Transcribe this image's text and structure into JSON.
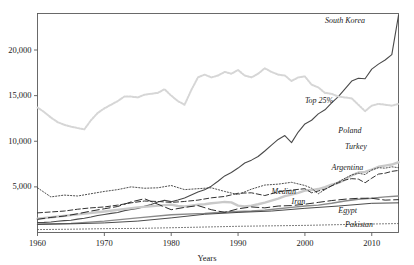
{
  "chart_data": {
    "type": "line",
    "title": "",
    "xlabel": "Years",
    "ylabel": "",
    "xlim": [
      1960,
      2014
    ],
    "ylim": [
      0,
      24000
    ],
    "grid": false,
    "legend_position": "inline-right-labels",
    "xticks": [
      1960,
      1970,
      1980,
      1990,
      2000,
      2010
    ],
    "xtick_labels": [
      "1960",
      "1970",
      "1980",
      "1990",
      "2000",
      "2010"
    ],
    "yticks": [
      5000,
      10000,
      15000,
      20000
    ],
    "ytick_labels": [
      "5,000",
      "10,000",
      "15,000",
      "20,000"
    ],
    "series": [
      {
        "name": "South Korea",
        "label": "South Korea",
        "style": "solid",
        "color": "#4a4a4a",
        "width": 1.1,
        "label_x": 2003,
        "label_y": 23100,
        "x": [
          1960,
          1961,
          1962,
          1963,
          1964,
          1965,
          1966,
          1967,
          1968,
          1969,
          1970,
          1971,
          1972,
          1973,
          1974,
          1975,
          1976,
          1977,
          1978,
          1979,
          1980,
          1981,
          1982,
          1983,
          1984,
          1985,
          1986,
          1987,
          1988,
          1989,
          1990,
          1991,
          1992,
          1993,
          1994,
          1995,
          1996,
          1997,
          1998,
          1999,
          2000,
          2001,
          2002,
          2003,
          2004,
          2005,
          2006,
          2007,
          2008,
          2009,
          2010,
          2011,
          2012,
          2013,
          2014
        ],
        "y": [
          1100,
          1110,
          1150,
          1230,
          1300,
          1350,
          1470,
          1560,
          1690,
          1860,
          1980,
          2100,
          2200,
          2400,
          2520,
          2640,
          2860,
          3060,
          3340,
          3530,
          3380,
          3570,
          3790,
          4110,
          4440,
          4690,
          5080,
          5620,
          6200,
          6570,
          7060,
          7620,
          7930,
          8330,
          8930,
          9580,
          10200,
          10620,
          9850,
          11010,
          11900,
          12300,
          13000,
          13450,
          14200,
          14900,
          15750,
          16600,
          16900,
          16850,
          17900,
          18450,
          18900,
          19500,
          23800
        ]
      },
      {
        "name": "Top 25%",
        "label": "Top 25%",
        "style": "dotted-light",
        "color": "#d6d6d6",
        "width": 2.0,
        "label_x": 2000,
        "label_y": 14300,
        "x": [
          1960,
          1961,
          1962,
          1963,
          1964,
          1965,
          1966,
          1967,
          1968,
          1969,
          1970,
          1971,
          1972,
          1973,
          1974,
          1975,
          1976,
          1977,
          1978,
          1979,
          1980,
          1981,
          1982,
          1983,
          1984,
          1985,
          1986,
          1987,
          1988,
          1989,
          1990,
          1991,
          1992,
          1993,
          1994,
          1995,
          1996,
          1997,
          1998,
          1999,
          2000,
          2001,
          2002,
          2003,
          2004,
          2005,
          2006,
          2007,
          2008,
          2009,
          2010,
          2011,
          2012,
          2013,
          2014
        ],
        "y": [
          13700,
          13200,
          12600,
          12100,
          11800,
          11600,
          11450,
          11300,
          12300,
          13100,
          13600,
          14000,
          14400,
          14900,
          14900,
          14800,
          15100,
          15200,
          15300,
          15700,
          15000,
          14400,
          14000,
          15600,
          17000,
          17300,
          17000,
          17200,
          17600,
          17400,
          17800,
          17200,
          17000,
          17400,
          18000,
          17600,
          17300,
          17200,
          16600,
          17000,
          17100,
          16200,
          15900,
          15300,
          15200,
          14900,
          14800,
          14700,
          14000,
          13300,
          13900,
          14100,
          14000,
          13900,
          14100
        ]
      },
      {
        "name": "Poland",
        "label": "Poland",
        "style": "solid-thick-gray",
        "color": "#c9c9c9",
        "width": 2.4,
        "label_x": 2005,
        "label_y": 11050,
        "x": [
          1960,
          1965,
          1970,
          1975,
          1980,
          1981,
          1982,
          1983,
          1984,
          1985,
          1986,
          1987,
          1988,
          1989,
          1990,
          1991,
          1992,
          1993,
          1994,
          1995,
          1996,
          1997,
          1998,
          1999,
          2000,
          2001,
          2002,
          2003,
          2004,
          2005,
          2006,
          2007,
          2008,
          2009,
          2010,
          2011,
          2012,
          2013,
          2014
        ],
        "y": [
          1500,
          1900,
          2300,
          2750,
          3050,
          2900,
          2850,
          2950,
          3050,
          3100,
          3200,
          3280,
          3350,
          3300,
          2950,
          2850,
          2950,
          3100,
          3280,
          3500,
          3720,
          3980,
          4150,
          4350,
          4600,
          4650,
          4760,
          4960,
          5240,
          5440,
          5800,
          6250,
          6570,
          6650,
          6900,
          7200,
          7330,
          7450,
          7700
        ]
      },
      {
        "name": "Turkey",
        "label": "Turkey",
        "style": "dashed",
        "color": "#333333",
        "width": 1.0,
        "label_x": 2006,
        "label_y": 9300,
        "x": [
          1960,
          1962,
          1964,
          1966,
          1968,
          1970,
          1972,
          1974,
          1976,
          1978,
          1980,
          1982,
          1984,
          1986,
          1988,
          1990,
          1992,
          1994,
          1996,
          1998,
          2000,
          2001,
          2002,
          2003,
          2004,
          2005,
          2006,
          2007,
          2008,
          2009,
          2010,
          2011,
          2012,
          2013,
          2014
        ],
        "y": [
          2150,
          2250,
          2350,
          2550,
          2700,
          2800,
          3000,
          3250,
          3450,
          3400,
          3300,
          3400,
          3550,
          3800,
          3950,
          4300,
          4350,
          4050,
          4450,
          4650,
          4800,
          4350,
          4550,
          4750,
          5100,
          5450,
          5750,
          5900,
          5850,
          5450,
          5950,
          6400,
          6500,
          6700,
          6800
        ]
      },
      {
        "name": "Argentina",
        "label": "Argentina",
        "style": "dotted",
        "color": "#3a3a3a",
        "width": 0.9,
        "label_x": 2004,
        "label_y": 7000,
        "x": [
          1960,
          1962,
          1964,
          1966,
          1968,
          1970,
          1972,
          1974,
          1976,
          1978,
          1980,
          1982,
          1984,
          1986,
          1988,
          1990,
          1992,
          1994,
          1996,
          1998,
          2000,
          2001,
          2002,
          2003,
          2004,
          2005,
          2006,
          2007,
          2008,
          2009,
          2010,
          2011,
          2012,
          2013,
          2014
        ],
        "y": [
          4900,
          3900,
          4100,
          4000,
          4250,
          4500,
          4700,
          5000,
          4850,
          4900,
          5150,
          4700,
          4800,
          4900,
          4500,
          4150,
          4750,
          5200,
          5300,
          5500,
          5150,
          4850,
          4250,
          4700,
          5150,
          5550,
          5950,
          6300,
          6500,
          6350,
          6850,
          7100,
          7050,
          7200,
          7100
        ]
      },
      {
        "name": "Median",
        "label": "Median",
        "style": "solid-gray",
        "color": "#8a8a8a",
        "width": 1.4,
        "label_x": 1995,
        "label_y": 4300,
        "x": [
          1960,
          1965,
          1970,
          1975,
          1980,
          1985,
          1988,
          1990,
          1992,
          1994,
          1996,
          1998,
          2000,
          2002,
          2004,
          2006,
          2008,
          2010,
          2012,
          2014
        ],
        "y": [
          900,
          1000,
          1250,
          1600,
          1950,
          2100,
          2250,
          2300,
          2350,
          2450,
          2600,
          2750,
          2900,
          3000,
          3200,
          3450,
          3650,
          3750,
          3900,
          4000
        ]
      },
      {
        "name": "Iran",
        "label": "Iran",
        "style": "long-dash",
        "color": "#2b2b2b",
        "width": 1.0,
        "label_x": 1998,
        "label_y": 3250,
        "x": [
          1960,
          1962,
          1964,
          1966,
          1968,
          1970,
          1972,
          1974,
          1976,
          1978,
          1980,
          1982,
          1984,
          1986,
          1988,
          1990,
          1992,
          1994,
          1996,
          1998,
          2000,
          2002,
          2004,
          2006,
          2008,
          2010,
          2012,
          2014
        ],
        "y": [
          1450,
          1650,
          1800,
          2050,
          2350,
          2600,
          2850,
          3350,
          3700,
          3100,
          2500,
          2750,
          2950,
          2500,
          2200,
          2600,
          2800,
          2700,
          2900,
          2950,
          3100,
          3300,
          3500,
          3650,
          3750,
          3750,
          3550,
          3600
        ]
      },
      {
        "name": "Egypt",
        "label": "Egypt",
        "style": "solid-thin",
        "color": "#2b2b2b",
        "width": 0.85,
        "label_x": 2005,
        "label_y": 2250,
        "x": [
          1960,
          1965,
          1970,
          1975,
          1980,
          1985,
          1990,
          1995,
          2000,
          2005,
          2010,
          2014
        ],
        "y": [
          900,
          950,
          1050,
          1250,
          1600,
          2000,
          2200,
          2350,
          2650,
          2900,
          3200,
          3250
        ]
      },
      {
        "name": "Pakistan",
        "label": "Pakistan",
        "style": "fine-dotted",
        "color": "#555555",
        "width": 0.8,
        "label_x": 2006,
        "label_y": 700,
        "x": [
          1960,
          1965,
          1970,
          1975,
          1980,
          1985,
          1990,
          1995,
          2000,
          2005,
          2010,
          2014
        ],
        "y": [
          320,
          360,
          420,
          450,
          520,
          600,
          680,
          730,
          780,
          860,
          930,
          980
        ]
      }
    ]
  },
  "axis": {
    "x_title": "Years"
  }
}
